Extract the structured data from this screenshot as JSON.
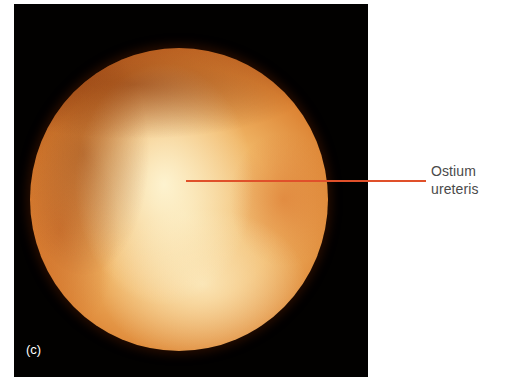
{
  "figure": {
    "panel_label": "(c)",
    "image_description": "endoscopic view",
    "annotation": {
      "line1": "Ostium",
      "line2": "ureteris"
    },
    "colors": {
      "background": "#ffffff",
      "panel_background": "#020100",
      "pointer_line": "#e0502a",
      "annotation_text": "#4a4a4a",
      "panel_label_text": "#ffffff"
    }
  }
}
